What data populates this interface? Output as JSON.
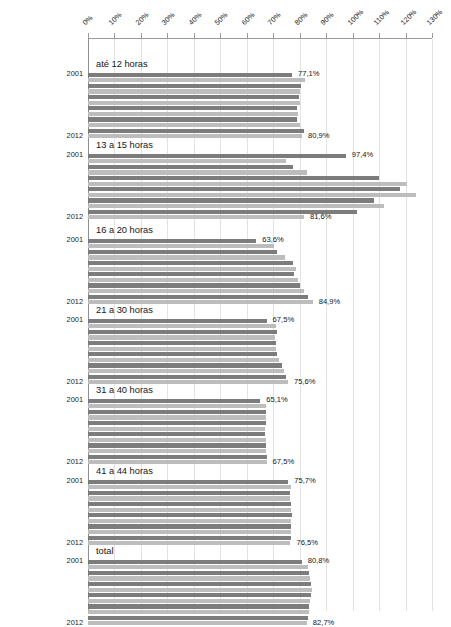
{
  "chart_data": {
    "type": "bar",
    "orientation": "horizontal",
    "title": "",
    "subtitle": "",
    "xlabel": "",
    "ylabel": "",
    "xlim": [
      0,
      130
    ],
    "grid": true,
    "legend": "none",
    "xticks": [
      "0%",
      "10%",
      "20%",
      "30%",
      "40%",
      "50%",
      "60%",
      "70%",
      "80%",
      "90%",
      "100%",
      "110%",
      "120%",
      "130%"
    ],
    "xtick_values": [
      0,
      10,
      20,
      30,
      40,
      50,
      60,
      70,
      80,
      90,
      100,
      110,
      120,
      130
    ],
    "series_axis_labels": [
      "2001",
      "2012"
    ],
    "years": [
      "2001",
      "2002",
      "2003",
      "2004",
      "2005",
      "2006",
      "2007",
      "2008",
      "2009",
      "2010",
      "2011",
      "2012"
    ],
    "value_suffix": "%",
    "colors": {
      "bar_dark": "#7c7c7c",
      "bar_light": "#bdbdbd",
      "gridline": "#e3e3e3",
      "axis": "#9a9a9a",
      "text": "#161616",
      "background": "#ffffff"
    },
    "groups": [
      {
        "label": "até 12 horas",
        "first_label": "77,1%",
        "last_label": "80,9%",
        "values": [
          77.1,
          82.0,
          80.6,
          80.0,
          79.8,
          80.2,
          78.9,
          79.5,
          79.0,
          80.1,
          81.6,
          80.9
        ]
      },
      {
        "label": "13 a 15 horas",
        "first_label": "97,4%",
        "last_label": "81,6%",
        "values": [
          97.4,
          75.0,
          77.3,
          82.6,
          110.0,
          120.5,
          117.8,
          123.9,
          108.0,
          112.0,
          101.5,
          81.6
        ]
      },
      {
        "label": "16 a 20 horas",
        "first_label": "63,6%",
        "last_label": "84,9%",
        "values": [
          63.6,
          70.2,
          71.5,
          74.3,
          77.4,
          78.6,
          77.9,
          79.3,
          80.1,
          81.7,
          83.2,
          84.9
        ]
      },
      {
        "label": "21 a 30 horas",
        "first_label": "67,5%",
        "last_label": "75,6%",
        "values": [
          67.5,
          70.9,
          71.4,
          70.6,
          71.2,
          71.0,
          71.5,
          72.1,
          73.4,
          74.2,
          74.8,
          75.6
        ]
      },
      {
        "label": "31 a 40 horas",
        "first_label": "65,1%",
        "last_label": "67,5%",
        "values": [
          65.1,
          67.4,
          67.3,
          67.2,
          67.1,
          67.0,
          66.9,
          67.2,
          67.3,
          67.4,
          67.5,
          67.5
        ]
      },
      {
        "label": "41 a 44 horas",
        "first_label": "75,7%",
        "last_label": "76,5%",
        "values": [
          75.7,
          76.6,
          76.5,
          76.4,
          76.6,
          76.8,
          77.0,
          76.9,
          76.8,
          76.7,
          76.6,
          76.5
        ]
      },
      {
        "label": "total",
        "first_label": "80,8%",
        "last_label": "82,7%",
        "values": [
          80.8,
          83.2,
          83.6,
          84.0,
          84.3,
          84.5,
          84.3,
          84.0,
          83.7,
          83.4,
          83.0,
          82.7
        ]
      }
    ]
  }
}
